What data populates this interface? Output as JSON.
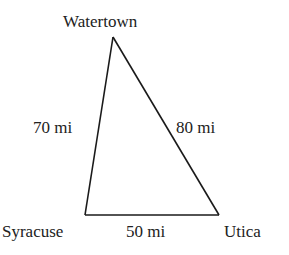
{
  "diagram": {
    "type": "triangle-distance-diagram",
    "line_color": "#1a1a1a",
    "text_color": "#222222",
    "vertices": [
      {
        "name": "Watertown",
        "x": 113,
        "y": 37
      },
      {
        "name": "Syracuse",
        "x": 85,
        "y": 215
      },
      {
        "name": "Utica",
        "x": 219,
        "y": 215
      }
    ],
    "city_labels": {
      "top": "Watertown",
      "bottom_left": "Syracuse",
      "bottom_right": "Utica"
    },
    "edge_labels": {
      "watertown_syracuse": "70 mi",
      "watertown_utica": "80 mi",
      "syracuse_utica": "50 mi"
    }
  }
}
